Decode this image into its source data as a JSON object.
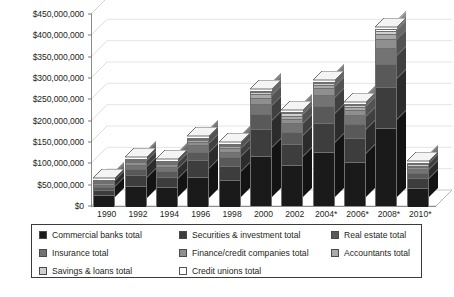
{
  "chart_data": {
    "type": "bar",
    "subtype": "stacked-column-3d",
    "title": "",
    "xlabel": "",
    "ylabel": "",
    "ylim": [
      0,
      450000000
    ],
    "ytick_step": 50000000,
    "ytick_labels": [
      "$450,000,000",
      "$400,000,000",
      "$350,000,000",
      "$300,000,000",
      "$250,000,000",
      "$200,000,000",
      "$150,000,000",
      "$100,000,000",
      "$50,000,000",
      "$0"
    ],
    "grid": true,
    "legend_position": "bottom",
    "categories": [
      "1990",
      "1992",
      "1994",
      "1996",
      "1998",
      "2000",
      "2002",
      "2004*",
      "2006*",
      "2008*",
      "2010*"
    ],
    "series": [
      {
        "name": "Commercial banks total",
        "color": "#1a1a1a",
        "values": [
          27000000,
          48000000,
          46000000,
          70000000,
          62000000,
          118000000,
          96000000,
          128000000,
          104000000,
          182000000,
          44000000
        ]
      },
      {
        "name": "Securities & investment total",
        "color": "#3d3d3d",
        "values": [
          13000000,
          26000000,
          24000000,
          38000000,
          34000000,
          62000000,
          50000000,
          68000000,
          56000000,
          96000000,
          22000000
        ]
      },
      {
        "name": "Real estate total",
        "color": "#595959",
        "values": [
          7000000,
          14000000,
          13000000,
          21000000,
          19000000,
          35000000,
          28000000,
          38000000,
          31000000,
          54000000,
          13000000
        ]
      },
      {
        "name": "Insurance total",
        "color": "#737373",
        "values": [
          5000000,
          10000000,
          10000000,
          15000000,
          14000000,
          25000000,
          20000000,
          27000000,
          22000000,
          38000000,
          9000000
        ]
      },
      {
        "name": "Finance/credit companies total",
        "color": "#8f8f8f",
        "values": [
          3000000,
          6000000,
          6000000,
          8000000,
          8000000,
          14000000,
          11000000,
          15000000,
          12000000,
          21000000,
          5000000
        ]
      },
      {
        "name": "Accountants total",
        "color": "#aaaaaa",
        "values": [
          2000000,
          3000000,
          3000000,
          4000000,
          4000000,
          8000000,
          7000000,
          8000000,
          7000000,
          12000000,
          3000000
        ]
      },
      {
        "name": "Savings & loans total",
        "color": "#cfcfcf",
        "values": [
          2000000,
          2000000,
          2000000,
          3000000,
          3000000,
          5000000,
          5000000,
          4000000,
          5000000,
          8000000,
          3000000
        ]
      },
      {
        "name": "Credit unions total",
        "color": "#ffffff",
        "values": [
          1000000,
          1000000,
          1000000,
          1000000,
          1000000,
          3000000,
          3000000,
          2000000,
          3000000,
          4000000,
          1000000
        ]
      }
    ],
    "totals": [
      60000000,
      110000000,
      105000000,
      160000000,
      145000000,
      270000000,
      220000000,
      290000000,
      240000000,
      415000000,
      100000000
    ]
  },
  "legend": {
    "items": [
      {
        "label": "Commercial banks total",
        "color": "#1a1a1a"
      },
      {
        "label": "Securities & investment total",
        "color": "#3d3d3d"
      },
      {
        "label": "Real estate total",
        "color": "#595959"
      },
      {
        "label": "Insurance total",
        "color": "#737373"
      },
      {
        "label": "Finance/credit companies total",
        "color": "#8f8f8f"
      },
      {
        "label": "Accountants total",
        "color": "#aaaaaa"
      },
      {
        "label": "Savings & loans total",
        "color": "#cfcfcf"
      },
      {
        "label": "Credit unions total",
        "color": "#ffffff"
      }
    ]
  }
}
